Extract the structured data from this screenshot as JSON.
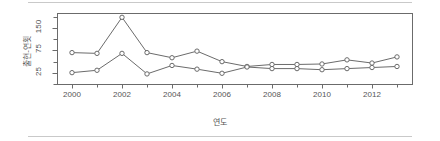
{
  "figure": {
    "background_color": "#ffffff",
    "rule_color": "#c9c9c9",
    "axis_color": "#6b6b6b",
    "line_color": "#6b6b6b",
    "marker_fill": "#ffffff",
    "text_color": "#555555"
  },
  "chart_data": {
    "type": "line",
    "title": "",
    "xlabel": "연도",
    "ylabel": "출현-연횟",
    "x": [
      2000,
      2001,
      2002,
      2003,
      2004,
      2005,
      2006,
      2007,
      2008,
      2009,
      2010,
      2011,
      2012,
      2013
    ],
    "xlim": [
      1999.4,
      2013.6
    ],
    "ylim": [
      10,
      215
    ],
    "yscale": "sqrt",
    "xticks": [
      2000,
      2002,
      2004,
      2006,
      2008,
      2010,
      2012
    ],
    "xtick_labels": [
      "2000",
      "2002",
      "2004",
      "2006",
      "2008",
      "2010",
      "2012"
    ],
    "yticks": [
      25,
      75,
      150
    ],
    "ytick_labels": [
      "25",
      "75",
      "150"
    ],
    "grid": false,
    "legend": null,
    "marker": "circle-open",
    "series": [
      {
        "name": "upper",
        "values": [
          68,
          66,
          195,
          68,
          55,
          72,
          46,
          36,
          40,
          40,
          41,
          50,
          43,
          57
        ]
      },
      {
        "name": "lower",
        "values": [
          25,
          29,
          66,
          23,
          38,
          31,
          24,
          35,
          32,
          32,
          30,
          32,
          34,
          36
        ]
      }
    ]
  }
}
